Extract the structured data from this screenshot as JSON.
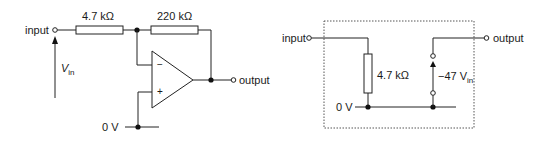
{
  "left_circuit": {
    "title": "Inverting amplifier",
    "input_label": "input",
    "output_label": "output",
    "ground_label": "0 V",
    "r_in_label": "4.7 kΩ",
    "r_f_label": "220 kΩ",
    "vin_label": "V",
    "vin_sub": "in",
    "opamp_minus": "−",
    "opamp_plus": "+"
  },
  "right_circuit": {
    "title": "Equivalent circuit",
    "input_label": "input",
    "output_label": "output",
    "ground_label": "0 V",
    "r_in_label": "4.7 kΩ",
    "source_label": "−47 V",
    "source_sub": "in"
  },
  "colors": {
    "line": "#222222",
    "background": "#ffffff",
    "dashed_box": "#555555"
  }
}
